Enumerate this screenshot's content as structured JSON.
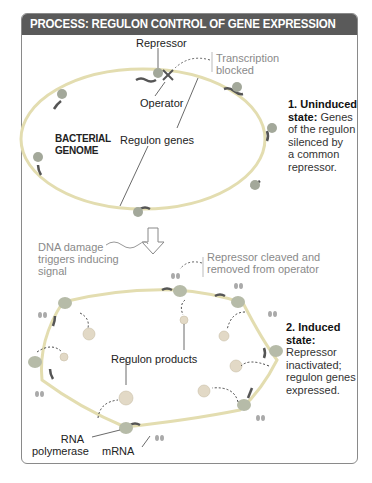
{
  "header": {
    "title": "PROCESS: REGULON CONTROL OF GENE EXPRESSION"
  },
  "colors": {
    "header_bg": "#5a5a5a",
    "dna": "#e8e3b0",
    "gene": "#555555",
    "protein": "#9aa58a",
    "label_gray": "#8a8a8a"
  },
  "uninduced": {
    "repressor_label": "Repressor",
    "transcription_blocked": [
      "Transcription",
      "blocked"
    ],
    "operator_label": "Operator",
    "genome_label": [
      "BACTERIAL",
      "GENOME"
    ],
    "regulon_genes_label": "Regulon genes",
    "state_title": "1. Uninduced",
    "state_title2": "state:",
    "state_text": [
      "Genes",
      "of the regulon",
      "silenced by",
      "a common",
      "repressor."
    ]
  },
  "transition": {
    "signal_label": [
      "DNA damage",
      "triggers inducing",
      "signal"
    ],
    "cleaved_label": [
      "Repressor cleaved and",
      "removed from operator"
    ]
  },
  "induced": {
    "products_label": "Regulon products",
    "state_title": "2. Induced",
    "state_title2": "state:",
    "state_text": [
      "Repressor",
      "inactivated;",
      "regulon genes",
      "expressed."
    ],
    "rna_polymerase_label": [
      "RNA",
      "polymerase"
    ],
    "mrna_label": "mRNA"
  }
}
